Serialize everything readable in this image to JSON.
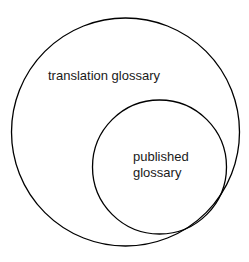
{
  "diagram": {
    "type": "nested-venn",
    "outer_set": {
      "label": "translation glossary",
      "stroke": "#000000"
    },
    "inner_set": {
      "label_line1": "published",
      "label_line2": "glossary",
      "stroke": "#000000"
    }
  }
}
